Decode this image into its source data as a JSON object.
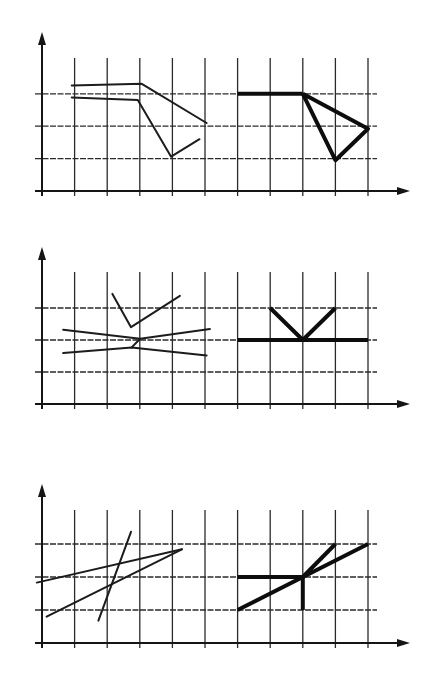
{
  "figure": {
    "colors": {
      "line": "#151515",
      "background": "#ffffff"
    },
    "grid": {
      "columns": 10,
      "rows": 3
    },
    "panels": [
      {
        "id": "panel-1",
        "left_shape": {
          "style": "thin",
          "paths": [
            [
              [
                0.91,
                3.26
              ],
              [
                3.06,
                3.31
              ],
              [
                5.05,
                2.1
              ]
            ],
            [
              [
                0.91,
                2.89
              ],
              [
                2.94,
                2.81
              ],
              [
                3.96,
                1.06
              ],
              [
                4.83,
                1.6
              ]
            ]
          ]
        },
        "right_shape": {
          "style": "thick",
          "paths": [
            [
              [
                6,
                3
              ],
              [
                8,
                3
              ]
            ],
            [
              [
                8,
                3
              ],
              [
                10,
                1.92
              ],
              [
                9,
                0.95
              ],
              [
                8,
                3
              ]
            ]
          ]
        }
      },
      {
        "id": "panel-2",
        "left_shape": {
          "style": "thin",
          "paths": [
            [
              [
                2.16,
                3.44
              ],
              [
                2.73,
                2.4
              ],
              [
                4.23,
                3.38
              ]
            ],
            [
              [
                0.65,
                2.32
              ],
              [
                3.01,
                2.04
              ],
              [
                5.15,
                2.34
              ]
            ],
            [
              [
                0.65,
                1.59
              ],
              [
                2.75,
                1.77
              ],
              [
                5.05,
                1.52
              ]
            ],
            [
              [
                2.75,
                1.77
              ],
              [
                3.01,
                2.04
              ]
            ]
          ]
        },
        "right_shape": {
          "style": "thick",
          "paths": [
            [
              [
                6,
                2
              ],
              [
                10,
                2
              ]
            ],
            [
              [
                7,
                3
              ],
              [
                8,
                2
              ],
              [
                9,
                3
              ]
            ]
          ]
        }
      },
      {
        "id": "panel-3",
        "left_shape": {
          "style": "thin",
          "paths": [
            [
              [
                -0.16,
                1.83
              ],
              [
                4.29,
                2.84
              ]
            ],
            [
              [
                0.14,
                0.8
              ],
              [
                4.29,
                2.84
              ]
            ],
            [
              [
                1.73,
                0.68
              ],
              [
                2.73,
                3.37
              ]
            ]
          ]
        },
        "right_shape": {
          "style": "thick",
          "paths": [
            [
              [
                6,
                2
              ],
              [
                8,
                2
              ]
            ],
            [
              [
                8,
                2
              ],
              [
                8,
                1
              ]
            ],
            [
              [
                6,
                1
              ],
              [
                10,
                3
              ]
            ],
            [
              [
                8,
                2
              ],
              [
                9,
                3
              ]
            ]
          ]
        }
      }
    ]
  }
}
